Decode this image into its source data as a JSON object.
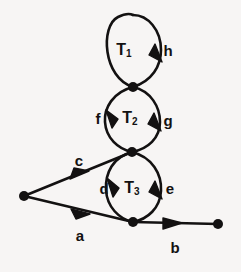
{
  "figure": {
    "background_color": "#f7f5f4",
    "ink_color": "#131111"
  },
  "loops": [
    {
      "id": "T1",
      "label": "T",
      "subscript": "1",
      "label_x": 124,
      "label_y": 50
    },
    {
      "id": "T2",
      "label": "T",
      "subscript": "2",
      "label_x": 130,
      "label_y": 118
    },
    {
      "id": "T3",
      "label": "T",
      "subscript": "3",
      "label_x": 132,
      "label_y": 188
    }
  ],
  "edges": [
    {
      "id": "h",
      "label": "h",
      "label_x": 168,
      "label_y": 50
    },
    {
      "id": "f",
      "label": "f",
      "label_x": 98,
      "label_y": 118
    },
    {
      "id": "g",
      "label": "g",
      "label_x": 168,
      "label_y": 120
    },
    {
      "id": "d",
      "label": "d",
      "label_x": 104,
      "label_y": 188
    },
    {
      "id": "e",
      "label": "e",
      "label_x": 170,
      "label_y": 188
    },
    {
      "id": "c",
      "label": "c",
      "label_x": 79,
      "label_y": 160
    },
    {
      "id": "a",
      "label": "a",
      "label_x": 80,
      "label_y": 235
    },
    {
      "id": "b",
      "label": "b",
      "label_x": 175,
      "label_y": 247
    }
  ],
  "nodes": [
    {
      "id": "source",
      "x": 24,
      "y": 196
    },
    {
      "id": "n-top",
      "x": 133,
      "y": 87
    },
    {
      "id": "n-mid",
      "x": 132,
      "y": 152
    },
    {
      "id": "n-bottom",
      "x": 133,
      "y": 222
    },
    {
      "id": "sink",
      "x": 218,
      "y": 224
    }
  ]
}
